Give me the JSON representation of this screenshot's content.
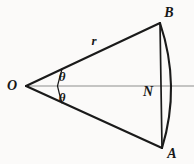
{
  "figure": {
    "kind": "circular-sector-geometry-diagram",
    "canvas": {
      "width": 194,
      "height": 164
    },
    "colors": {
      "background": "#fbfaf9",
      "stroke": "#1a1a1a",
      "axis": "#8d8d8d",
      "label": "#171717"
    },
    "labels": {
      "vertex_o": "O",
      "point_b": "B",
      "point_a": "A",
      "point_n": "N",
      "radius": "r",
      "angle_upper": "θ",
      "angle_lower": "θ"
    },
    "label_positions": {
      "vertex_o": {
        "x": 12,
        "y": 86
      },
      "point_b": {
        "x": 169,
        "y": 13
      },
      "point_a": {
        "x": 172,
        "y": 154
      },
      "point_n": {
        "x": 148,
        "y": 92
      },
      "radius": {
        "x": 94,
        "y": 40
      },
      "angle_upper": {
        "x": 62,
        "y": 76
      },
      "angle_lower": {
        "x": 62,
        "y": 97
      }
    },
    "geometry": {
      "origin": {
        "x": 26,
        "y": 86
      },
      "point_b": {
        "x": 160,
        "y": 23
      },
      "point_a": {
        "x": 162,
        "y": 148
      },
      "arc_apex": {
        "x": 174,
        "y": 86
      },
      "axis_start": {
        "x": 26,
        "y": 86
      },
      "axis_end": {
        "x": 194,
        "y": 86
      },
      "angle_arc_upper_radius": 36,
      "angle_arc_lower_radius": 36
    }
  }
}
